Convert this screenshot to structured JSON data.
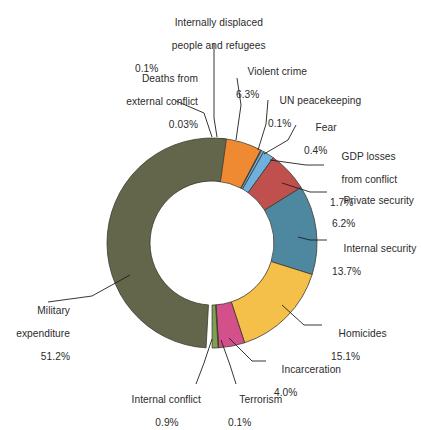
{
  "chart_data": {
    "type": "pie",
    "variant": "donut",
    "title": "",
    "subtitle": "",
    "xlabel": "",
    "ylabel": "",
    "legend_position": "none",
    "grid": false,
    "units": "percent",
    "total": 100,
    "categories": [
      "Military expenditure",
      "Deaths from external conflict",
      "Internally displaced people and refugees",
      "Violent crime",
      "UN peacekeeping",
      "Fear",
      "GDP losses from conflict",
      "Private security",
      "Internal security",
      "Homicides",
      "Incarceration",
      "Terrorism",
      "Internal conflict"
    ],
    "values": [
      51.2,
      0.03,
      0.1,
      6.3,
      0.1,
      0.4,
      1.7,
      6.2,
      13.7,
      15.1,
      4.0,
      0.1,
      0.9
    ],
    "value_labels": [
      "51.2%",
      "0.03%",
      "0.1%",
      "6.3%",
      "0.1%",
      "0.4%",
      "1.7%",
      "6.2%",
      "13.7%",
      "15.1%",
      "4.0%",
      "0.1%",
      "0.9%"
    ],
    "colors": [
      "#63664a",
      "#ffffff",
      "#ffffff",
      "#ef8a33",
      "#ef8a33",
      "#6fb0dc",
      "#6fb0dc",
      "#c0504d",
      "#4e87a0",
      "#f5c04a",
      "#d4508a",
      "#7fa050",
      "#7fa050"
    ],
    "slices": [
      {
        "label": "Military expenditure",
        "value": 51.2,
        "value_label": "51.2%",
        "color": "#63664a"
      },
      {
        "label": "Deaths from external conflict",
        "value": 0.03,
        "value_label": "0.03%",
        "color": "#ffffff"
      },
      {
        "label": "Internally displaced people and refugees",
        "value": 0.1,
        "value_label": "0.1%",
        "color": "#ffffff"
      },
      {
        "label": "Violent crime",
        "value": 6.3,
        "value_label": "6.3%",
        "color": "#ef8a33"
      },
      {
        "label": "UN peacekeeping",
        "value": 0.1,
        "value_label": "0.1%",
        "color": "#ef8a33"
      },
      {
        "label": "Fear",
        "value": 0.4,
        "value_label": "0.4%",
        "color": "#6fb0dc"
      },
      {
        "label": "GDP losses from conflict",
        "value": 1.7,
        "value_label": "1.7%",
        "color": "#6fb0dc"
      },
      {
        "label": "Private security",
        "value": 6.2,
        "value_label": "6.2%",
        "color": "#c0504d"
      },
      {
        "label": "Internal security",
        "value": 13.7,
        "value_label": "13.7%",
        "color": "#4e87a0"
      },
      {
        "label": "Homicides",
        "value": 15.1,
        "value_label": "15.1%",
        "color": "#f5c04a"
      },
      {
        "label": "Incarceration",
        "value": 4.0,
        "value_label": "4.0%",
        "color": "#d4508a"
      },
      {
        "label": "Terrorism",
        "value": 0.1,
        "value_label": "0.1%",
        "color": "#7fa050"
      },
      {
        "label": "Internal conflict",
        "value": 0.9,
        "value_label": "0.9%",
        "color": "#7fa050"
      }
    ]
  },
  "labels": {
    "idp": {
      "line1": "Internally displaced",
      "line2": "people and refugees",
      "pct": "0.1%"
    },
    "deaths_external": {
      "line1": "Deaths from",
      "line2": "external conflict",
      "pct": "0.03%"
    },
    "violent_crime": {
      "line1": "Violent crime",
      "pct": "6.3%"
    },
    "un_peacekeeping": {
      "line1": "UN peacekeeping",
      "pct": "0.1%"
    },
    "fear": {
      "line1": "Fear",
      "pct": "0.4%"
    },
    "gdp_losses": {
      "line1": "GDP losses",
      "line2": "from conflict",
      "pct": "1.7%"
    },
    "private_security": {
      "line1": "Private security",
      "pct": "6.2%"
    },
    "internal_security": {
      "line1": "Internal security",
      "pct": "13.7%"
    },
    "homicides": {
      "line1": "Homicides",
      "pct": "15.1%"
    },
    "incarceration": {
      "line1": "Incarceration",
      "pct": "4.0%"
    },
    "terrorism": {
      "line1": "Terrorism",
      "pct": "0.1%"
    },
    "internal_conflict": {
      "line1": "Internal conflict",
      "pct": "0.9%"
    },
    "military": {
      "line1": "Military",
      "line2": "expenditure",
      "pct": "51.2%"
    }
  }
}
